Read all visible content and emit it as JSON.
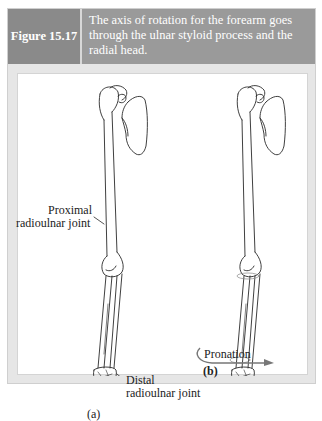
{
  "figure": {
    "number_label": "Figure 15.17",
    "caption": "The axis of rotation for the forearm goes through the ulnar styloid process and the radial head."
  },
  "panel_a": {
    "label": "(a)",
    "proximal_label_line1": "Proximal",
    "proximal_label_line2": "radioulnar joint",
    "distal_label_line1": "Distal",
    "distal_label_line2": "radioulnar joint"
  },
  "panel_b": {
    "label": "(b)",
    "motion_label": "Pronation"
  },
  "colors": {
    "header_label_bg": "#8a8a8a",
    "header_caption_bg": "#9a9a9a",
    "frame_bg": "#e6e6e6",
    "line": "#2a2a2a",
    "arrow": "#777777"
  }
}
